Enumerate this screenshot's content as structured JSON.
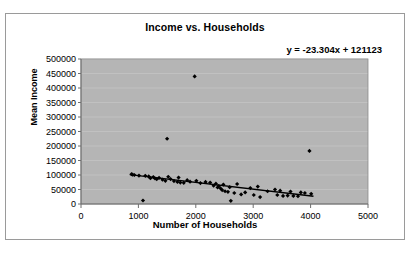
{
  "chart_data": {
    "type": "scatter",
    "title": "Income vs. Households",
    "xlabel": "Number of Households",
    "ylabel": "Mean Income",
    "annotation": "y = -23.304x + 121123",
    "xlim": [
      0,
      5000
    ],
    "ylim": [
      0,
      500000
    ],
    "xticks": [
      0,
      1000,
      2000,
      3000,
      4000,
      5000
    ],
    "yticks": [
      0,
      50000,
      100000,
      150000,
      200000,
      250000,
      300000,
      350000,
      400000,
      450000,
      500000
    ],
    "xtick_labels": [
      "0",
      "1000",
      "2000",
      "3000",
      "4000",
      "5000"
    ],
    "ytick_labels": [
      "0",
      "50000",
      "100000",
      "150000",
      "200000",
      "250000",
      "300000",
      "350000",
      "400000",
      "450000",
      "500000"
    ],
    "grid": "horizontal",
    "legend": "none",
    "plot_background": "#b5b5b5",
    "marker_color": "#000000",
    "marker_shape": "diamond",
    "trendline": {
      "type": "linear",
      "slope": -23.304,
      "intercept": 121123,
      "color": "#000000",
      "x_start": 850,
      "x_end": 4050
    },
    "points": [
      [
        880,
        103000
      ],
      [
        900,
        101000
      ],
      [
        930,
        100000
      ],
      [
        1010,
        98000
      ],
      [
        1080,
        12000
      ],
      [
        1120,
        97000
      ],
      [
        1180,
        95000
      ],
      [
        1210,
        89000
      ],
      [
        1260,
        93000
      ],
      [
        1290,
        88000
      ],
      [
        1320,
        86000
      ],
      [
        1360,
        90000
      ],
      [
        1420,
        84000
      ],
      [
        1470,
        80000
      ],
      [
        1500,
        225000
      ],
      [
        1520,
        94000
      ],
      [
        1560,
        86000
      ],
      [
        1620,
        79000
      ],
      [
        1680,
        76000
      ],
      [
        1700,
        91000
      ],
      [
        1730,
        74000
      ],
      [
        1790,
        73000
      ],
      [
        1850,
        82000
      ],
      [
        1900,
        77000
      ],
      [
        1980,
        440000
      ],
      [
        2010,
        80000
      ],
      [
        2080,
        72000
      ],
      [
        2170,
        76000
      ],
      [
        2250,
        74000
      ],
      [
        2310,
        63000
      ],
      [
        2350,
        70000
      ],
      [
        2380,
        57000
      ],
      [
        2400,
        62000
      ],
      [
        2430,
        54000
      ],
      [
        2460,
        48000
      ],
      [
        2480,
        67000
      ],
      [
        2510,
        44000
      ],
      [
        2560,
        42000
      ],
      [
        2590,
        58000
      ],
      [
        2610,
        11000
      ],
      [
        2670,
        38000
      ],
      [
        2720,
        69000
      ],
      [
        2790,
        33000
      ],
      [
        2860,
        40000
      ],
      [
        2950,
        55000
      ],
      [
        3010,
        31000
      ],
      [
        3080,
        60000
      ],
      [
        3120,
        24000
      ],
      [
        3250,
        44000
      ],
      [
        3380,
        50000
      ],
      [
        3420,
        31000
      ],
      [
        3470,
        46000
      ],
      [
        3520,
        28000
      ],
      [
        3600,
        29000
      ],
      [
        3650,
        43000
      ],
      [
        3700,
        28000
      ],
      [
        3780,
        27000
      ],
      [
        3830,
        40000
      ],
      [
        3900,
        38000
      ],
      [
        3980,
        183000
      ],
      [
        4010,
        35000
      ]
    ]
  }
}
